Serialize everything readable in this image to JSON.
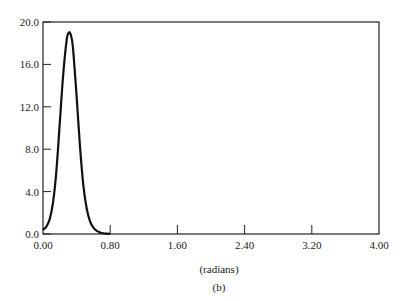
{
  "chart_data": {
    "type": "line",
    "title": "",
    "xlabel": "(radians)",
    "ylabel": "",
    "caption": "(b)",
    "xlim": [
      0,
      4.0
    ],
    "ylim": [
      0,
      20.0
    ],
    "grid": false,
    "legend": null,
    "x_ticks": [
      "0.00",
      "0.80",
      "1.60",
      "2.40",
      "3.20",
      "4.00"
    ],
    "y_ticks": [
      "0.0",
      "4.0",
      "8.0",
      "12.0",
      "16.0",
      "20.0"
    ],
    "series": [
      {
        "name": "curve",
        "x": [
          0.0,
          0.04,
          0.08,
          0.12,
          0.16,
          0.2,
          0.24,
          0.28,
          0.3,
          0.32,
          0.34,
          0.36,
          0.4,
          0.44,
          0.48,
          0.52,
          0.56,
          0.6,
          0.64,
          0.68,
          0.72,
          0.76,
          0.8
        ],
        "y": [
          0.4,
          0.7,
          1.4,
          3.0,
          6.0,
          10.5,
          15.0,
          18.2,
          18.9,
          19.0,
          18.5,
          17.3,
          13.0,
          8.3,
          4.6,
          2.4,
          1.2,
          0.6,
          0.3,
          0.15,
          0.07,
          0.03,
          0.0
        ]
      }
    ]
  }
}
